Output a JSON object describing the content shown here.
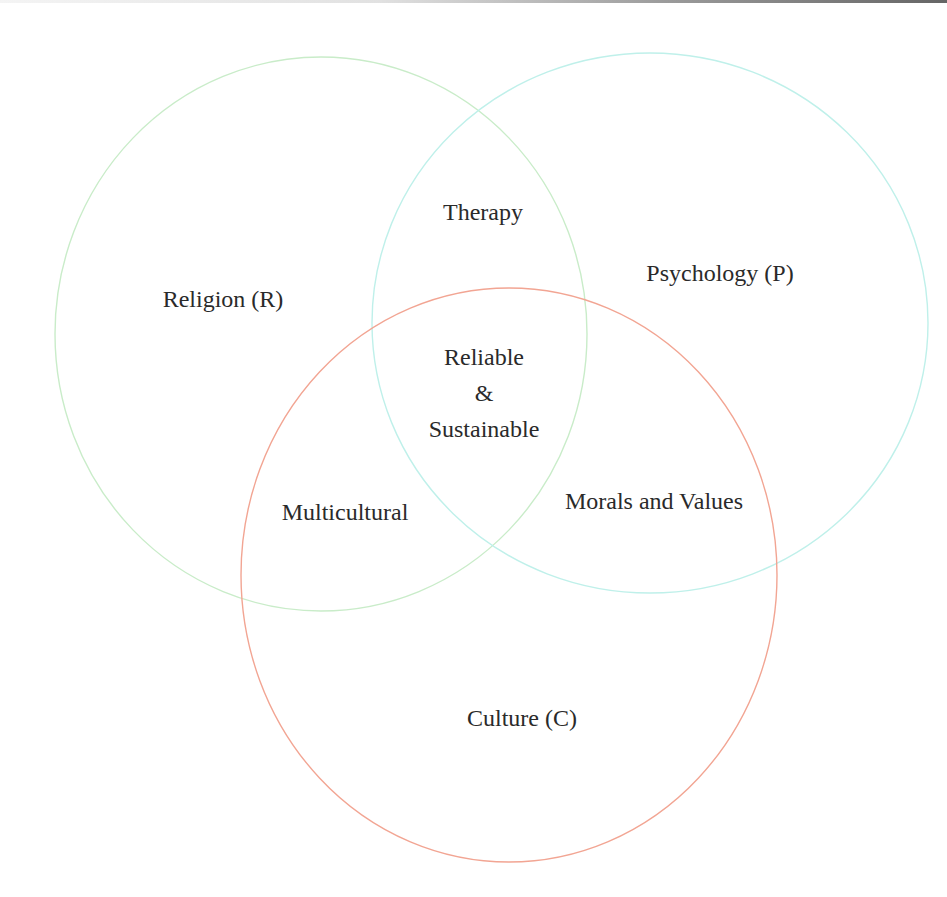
{
  "diagram": {
    "type": "venn",
    "sets": [
      {
        "id": "R",
        "label": "Religion (R)",
        "color": "#c9ecc9"
      },
      {
        "id": "P",
        "label": "Psychology (P)",
        "color": "#bff0ea"
      },
      {
        "id": "C",
        "label": "Culture (C)",
        "color": "#f2a593"
      }
    ],
    "intersections": {
      "R_P": "Therapy",
      "R_C": "Multicultural",
      "P_C": "Morals and Values",
      "R_P_C": {
        "line1": "Reliable",
        "line2": "&",
        "line3": "Sustainable"
      }
    }
  }
}
